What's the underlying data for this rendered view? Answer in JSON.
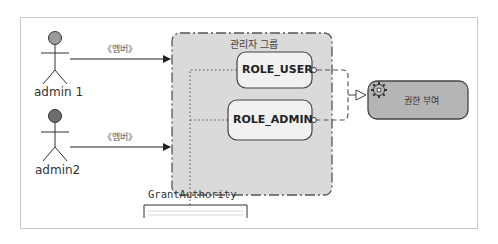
{
  "diagram": {
    "actors": [
      {
        "name": "admin 1",
        "head_color": "#9b9b9b"
      },
      {
        "name": "admin2",
        "head_color": "#6e6e6e"
      }
    ],
    "associations": [
      {
        "from": "admin 1",
        "to": "관리자 그룹",
        "stereotype": "《멤버》"
      },
      {
        "from": "admin2",
        "to": "관리자 그룹",
        "stereotype": "《멤버》"
      }
    ],
    "group": {
      "title": "관리자 그룹",
      "fill": "#d9d9d9",
      "roles": [
        {
          "label": "ROLE_USER"
        },
        {
          "label": "ROLE_ADMIN"
        }
      ]
    },
    "task": {
      "label": "권한 부여",
      "icon": "gear-icon",
      "fill": "#b5b5b5"
    },
    "note": {
      "label": "GrantAuthority"
    }
  }
}
